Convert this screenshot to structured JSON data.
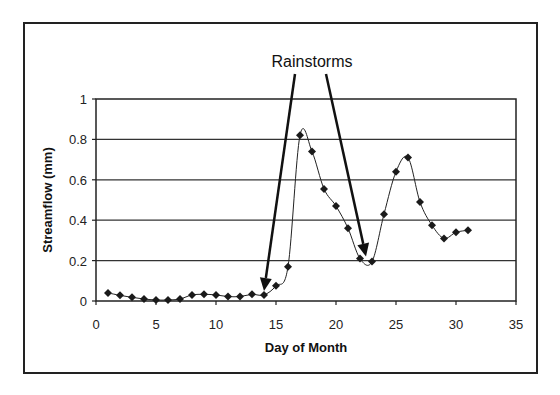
{
  "chart_data": {
    "type": "line",
    "title": "",
    "xlabel": "Day of Month",
    "ylabel": "Streamflow (mm)",
    "xlim": [
      0,
      35
    ],
    "ylim": [
      0,
      1
    ],
    "xticks": [
      0,
      5,
      10,
      15,
      20,
      25,
      30,
      35
    ],
    "yticks": [
      0,
      0.2,
      0.4,
      0.6,
      0.8,
      1
    ],
    "ytick_labels": [
      "0",
      "0.2",
      "0.4",
      "0.6",
      "0.8",
      "1"
    ],
    "grid": "horizontal",
    "legend": "none",
    "marker": "diamond",
    "line_color": "#222222",
    "series": [
      {
        "name": "Streamflow",
        "x": [
          1,
          2,
          3,
          4,
          5,
          6,
          7,
          8,
          9,
          10,
          11,
          12,
          13,
          14,
          15,
          16,
          17,
          18,
          19,
          20,
          21,
          22,
          23,
          24,
          25,
          26,
          27,
          28,
          29,
          30,
          31
        ],
        "values": [
          0.04,
          0.028,
          0.018,
          0.01,
          0.005,
          0.005,
          0.01,
          0.03,
          0.033,
          0.03,
          0.022,
          0.022,
          0.033,
          0.03,
          0.075,
          0.17,
          0.82,
          0.74,
          0.555,
          0.47,
          0.36,
          0.21,
          0.195,
          0.43,
          0.64,
          0.71,
          0.49,
          0.375,
          0.31,
          0.34,
          0.35
        ]
      }
    ],
    "annotations": [
      {
        "text": "Rainstorms",
        "arrows_to": [
          {
            "x": 14,
            "y": 0.05
          },
          {
            "x": 22.5,
            "y": 0.22
          }
        ]
      }
    ]
  }
}
